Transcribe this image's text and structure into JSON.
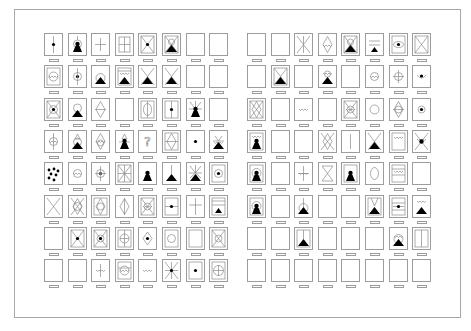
{
  "palette": {
    "title": "",
    "colors": {
      "border": "#9c9c9c",
      "stroke": "#8a8a8a",
      "fill": "#000000",
      "background": "#ffffff"
    },
    "groups": [
      {
        "name": "left-group",
        "x0": 44,
        "y0": 33,
        "dx": 23.6,
        "dy": 32.3,
        "rows": [
          [
            "dot-vline",
            "figure-halo",
            "crosshair",
            "grid-window",
            "x-frame-dot",
            "x-frame-figure",
            "blank",
            "blank"
          ],
          [
            "circle-wave-frame",
            "circle-dot-vline",
            "mountain-arc",
            "mountain-wave-frame",
            "x-figure",
            "x-figure-plain",
            "blank",
            "blank"
          ],
          [
            "x-frame-circle-dot",
            "figure-circle",
            "diamond-vline",
            "blank",
            "ellipse-frame",
            "dot-vline-frame",
            "rays-figure",
            "blank"
          ],
          [
            "circle-wave-vline",
            "figure-arc",
            "diamond-wave",
            "figure-lines",
            "question-mark",
            "diamond-frame",
            "dot",
            "figure-rays-wave"
          ],
          [
            "scattered-dots",
            "circle-wave",
            "circle-dot-cross",
            "x-frame-star",
            "figure-plain",
            "mountain-vline",
            "rays-figure-star",
            "frame-circle-dot"
          ],
          [
            "x-plain",
            "circle-ornate",
            "diamond-frame-circle",
            "diamond-vline-tall",
            "x-frame-ornate",
            "dot-hline-frame",
            "crosshair-tall",
            "frame-figure-lines"
          ],
          [
            "blank",
            "x-frame-dot",
            "x-frame-dot-circle",
            "circle-cross-frame",
            "diamond-dot",
            "frame-circle",
            "frame-blank",
            "x-frame-circle"
          ],
          [
            "blank",
            "blank",
            "wave-vline",
            "frame-wave-circle",
            "wave",
            "star-dot",
            "frame-dot",
            "circle-grid-frame"
          ]
        ]
      },
      {
        "name": "right-group",
        "x0": 247,
        "y0": 33,
        "dx": 23.6,
        "dy": 32.3,
        "rows": [
          [
            "blank",
            "blank",
            "star-lines",
            "diamond-wave-tall",
            "x-frame-figure",
            "hline-mountain",
            "frame-eye",
            "x-frame-plain"
          ],
          [
            "blank",
            "hourglass-figure",
            "blank",
            "wave-figure-frame",
            "blank",
            "circle-wave",
            "crosshair-circle",
            "bowl-dot"
          ],
          [
            "diamond-frame-x",
            "blank",
            "wave",
            "blank",
            "x-frame-ornate",
            "circle",
            "diamond-cross",
            "circle-dot"
          ],
          [
            "frame-figure-wave",
            "blank",
            "blank",
            "x-diamond",
            "vline",
            "x-figure",
            "frame-wave",
            "rays-dot-wave"
          ],
          [
            "frame-figure-halo",
            "blank",
            "wave-cross",
            "hourglass",
            "frame-figure-plain",
            "ellipse",
            "frame-wave-lines",
            "blank"
          ],
          [
            "frame-figure-halo",
            "blank",
            "mountain-arc-vline",
            "blank",
            "blank",
            "frame-mountain-rays",
            "frame-dot-hline",
            "wave-mountain"
          ],
          [
            "blank",
            "blank",
            "frame-mountain-vline",
            "blank",
            "blank",
            "blank",
            "mountain-arc-wave",
            "frame-vlines"
          ],
          [
            "blank",
            "blank",
            "blank",
            "blank",
            "blank",
            "blank",
            "blank",
            "blank"
          ]
        ]
      }
    ]
  }
}
